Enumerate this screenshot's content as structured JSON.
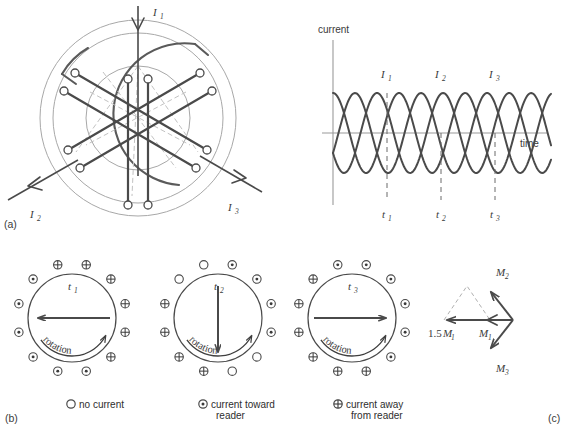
{
  "figure": {
    "panels": {
      "a": "(a)",
      "b": "(b)",
      "c": "(c)"
    }
  },
  "motor_diagram": {
    "current_labels": [
      {
        "name": "I1",
        "base": "I",
        "sub": "1"
      },
      {
        "name": "I2",
        "base": "I",
        "sub": "2"
      },
      {
        "name": "I3",
        "base": "I",
        "sub": "3"
      }
    ]
  },
  "chart_data": {
    "type": "line",
    "title": "",
    "xlabel": "time",
    "ylabel": "current",
    "grid": false,
    "legend": "inline-annotations",
    "xlim": [
      0,
      3.3
    ],
    "ylim": [
      -1.15,
      1.15
    ],
    "x_axis_label": "time",
    "y_axis_label": "current",
    "n_points": 200,
    "series": [
      {
        "name": "I1",
        "label": "I1",
        "amplitude": 1.0,
        "period": 1.0,
        "phase_deg": 0
      },
      {
        "name": "I2",
        "label": "I2",
        "amplitude": 1.0,
        "period": 1.0,
        "phase_deg": -120
      },
      {
        "name": "I3",
        "label": "I3",
        "amplitude": 1.0,
        "period": 1.0,
        "phase_deg": -240
      }
    ],
    "peak_labels": [
      {
        "text": "I",
        "sub": "1",
        "x": 0.25
      },
      {
        "text": "I",
        "sub": "2",
        "x": 0.583
      },
      {
        "text": "I",
        "sub": "3",
        "x": 0.917
      }
    ],
    "time_markers": [
      {
        "text": "t",
        "sub": "1",
        "x": 0.25,
        "value": 1.0
      },
      {
        "text": "t",
        "sub": "2",
        "x": 0.5,
        "value": 0.0
      },
      {
        "text": "t",
        "sub": "3",
        "x": 0.75,
        "value": -1.0
      }
    ]
  },
  "field_diagrams": [
    {
      "id": "t1",
      "time_label": {
        "base": "t",
        "sub": "1"
      },
      "rotation_label": "rotation",
      "arrow_direction": "left",
      "markers": [
        "away",
        "away",
        "away",
        "away",
        "away",
        "away",
        "toward",
        "toward",
        "toward",
        "toward",
        "toward",
        "toward"
      ]
    },
    {
      "id": "t2",
      "time_label": {
        "base": "t",
        "sub": "2"
      },
      "rotation_label": "rotation",
      "arrow_direction": "down",
      "markers": [
        "none",
        "toward",
        "toward",
        "toward",
        "toward",
        "none",
        "none",
        "away",
        "away",
        "away",
        "away",
        "none"
      ]
    },
    {
      "id": "t3",
      "time_label": {
        "base": "t",
        "sub": "3"
      },
      "rotation_label": "rotation",
      "arrow_direction": "right",
      "markers": [
        "toward",
        "toward",
        "toward",
        "toward",
        "toward",
        "toward",
        "away",
        "away",
        "away",
        "away",
        "away",
        "away"
      ]
    }
  ],
  "legend": {
    "items": [
      {
        "symbol": "no-current-circle",
        "text": "no current",
        "text2": ""
      },
      {
        "symbol": "current-toward-reader-dot",
        "text": "current toward",
        "text2": "reader"
      },
      {
        "symbol": "current-away-from-reader-cross",
        "text": "current away",
        "text2": "from reader"
      }
    ]
  },
  "vector_diagram": {
    "vectors": [
      {
        "name": "M2",
        "base": "M",
        "sub": "2",
        "angle_deg": 135
      },
      {
        "name": "M3",
        "base": "M",
        "sub": "3",
        "angle_deg": 225
      },
      {
        "name": "M1",
        "base": "M",
        "sub": "1",
        "angle_deg": 180
      },
      {
        "name": "1.5M1",
        "prefix": "1.5",
        "base": "M",
        "sub": "1",
        "angle_deg": 180
      }
    ],
    "labels": {
      "m1": "M",
      "m1_sub": "1",
      "m15_prefix": "1.5",
      "m15_base": "M",
      "m15_sub": "1",
      "m2": "M",
      "m2_sub": "2",
      "m3": "M",
      "m3_sub": "3"
    }
  },
  "colors": {
    "line_dark": "#4a4a4a",
    "line_mid": "#606060",
    "line_light": "#9a9a9a",
    "line_faint": "#b4b4b4",
    "text": "#3a3a3a",
    "background": "#ffffff"
  }
}
